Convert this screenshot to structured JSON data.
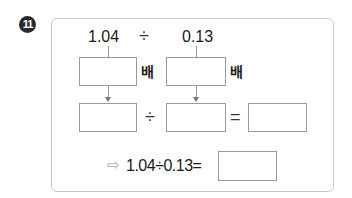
{
  "problem": {
    "number": "11",
    "dividend": "1.04",
    "divisor": "0.13",
    "divide_symbol": "÷",
    "equals_symbol": "=",
    "times_label": "배",
    "hint_arrow": "⇨",
    "summary_expression": "1.04÷0.13="
  },
  "inputs": {
    "dividend_multiplier": "",
    "divisor_multiplier": "",
    "scaled_dividend": "",
    "scaled_divisor": "",
    "scaled_quotient": "",
    "final_answer": ""
  }
}
